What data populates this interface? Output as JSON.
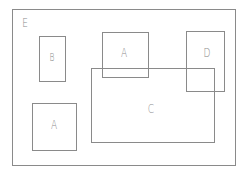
{
  "diagram": {
    "line_color": "#8a8a8a",
    "boxes": [
      {
        "id": "E",
        "label": "E",
        "x": 12,
        "y": 9,
        "w": 224,
        "h": 157,
        "label_x": 25,
        "label_y": 23,
        "font": 12
      },
      {
        "id": "B",
        "label": "B",
        "x": 39,
        "y": 36,
        "w": 27,
        "h": 46,
        "label_x": 52,
        "label_y": 58,
        "font": 10
      },
      {
        "id": "A1",
        "label": "A",
        "x": 102,
        "y": 32,
        "w": 47,
        "h": 46,
        "label_x": 124,
        "label_y": 53,
        "font": 12
      },
      {
        "id": "D",
        "label": "D",
        "x": 186,
        "y": 31,
        "w": 39,
        "h": 61,
        "label_x": 207,
        "label_y": 53,
        "font": 12
      },
      {
        "id": "C",
        "label": "C",
        "x": 91,
        "y": 68,
        "w": 124,
        "h": 75,
        "label_x": 151,
        "label_y": 109,
        "font": 12
      },
      {
        "id": "A2",
        "label": "A",
        "x": 32,
        "y": 103,
        "w": 45,
        "h": 48,
        "label_x": 54,
        "label_y": 125,
        "font": 12
      }
    ]
  }
}
